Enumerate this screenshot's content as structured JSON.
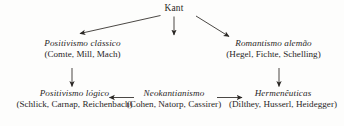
{
  "diagram": {
    "type": "flow-tree",
    "title_text": "Kant",
    "ink_color": "#29261f",
    "background_color": "#fdfdfc",
    "nodes": {
      "root": {
        "label": "Kant"
      },
      "classical_positivism": {
        "title": "Positivismo clássico",
        "members": "(Comte, Mill, Mach)"
      },
      "german_romanticism": {
        "title": "Romantismo alemão",
        "members": "(Hegel, Fichte, Schelling)"
      },
      "logical_positivism": {
        "title": "Positivismo lógico",
        "members": "(Schlick, Carnap, Reichenbach)"
      },
      "neokantianism": {
        "title": "Neokantianismo",
        "members": "(Cohen, Natorp, Cassirer)"
      },
      "hermeneutics": {
        "title": "Hermenêuticas",
        "members": "(Dilthey, Husserl, Heidegger)"
      }
    },
    "edges": [
      {
        "from": "root",
        "to": "classical_positivism",
        "direction": "down-left"
      },
      {
        "from": "root",
        "to": "neokantianism",
        "direction": "down"
      },
      {
        "from": "root",
        "to": "german_romanticism",
        "direction": "down-right"
      },
      {
        "from": "classical_positivism",
        "to": "logical_positivism",
        "direction": "down"
      },
      {
        "from": "german_romanticism",
        "to": "hermeneutics",
        "direction": "down"
      },
      {
        "from": "neokantianism",
        "to": "logical_positivism",
        "direction": "left"
      },
      {
        "from": "neokantianism",
        "to": "hermeneutics",
        "direction": "right"
      }
    ]
  }
}
